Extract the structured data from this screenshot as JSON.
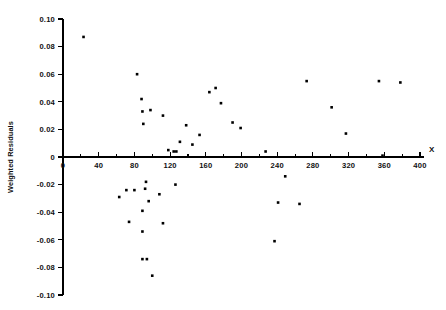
{
  "figure": {
    "title": "",
    "x_axis_name": "X",
    "y_axis_name": "Weighted Residuals"
  },
  "chart_data": {
    "type": "scatter",
    "title": "",
    "xlabel": "X",
    "ylabel": "Weighted Residuals",
    "xlim": [
      0,
      400
    ],
    "ylim": [
      -0.1,
      0.1
    ],
    "grid": false,
    "legend": null,
    "x_ticks_major": [
      0,
      40,
      80,
      120,
      160,
      200,
      240,
      280,
      320,
      360,
      400
    ],
    "x_tick_labels": [
      "0",
      "40",
      "80",
      "120",
      "160",
      "200",
      "240",
      "280",
      "320",
      "360",
      "400"
    ],
    "x_minor_tick_interval": 20,
    "y_ticks_major": [
      0.1,
      0.08,
      0.06,
      0.04,
      0.02,
      0,
      -0.02,
      -0.04,
      -0.06,
      -0.08,
      -0.1
    ],
    "y_tick_labels": [
      "0.10",
      "0.08",
      "0.06",
      "0.04",
      "0.02",
      "0",
      "-0.02",
      "-0.04",
      "-0.06",
      "-0.08",
      "-0.10"
    ],
    "marker": "square",
    "marker_color": "#000000",
    "marker_size_px": 2.6,
    "n_points": 44,
    "points": [
      {
        "x": 23,
        "y": 0.087
      },
      {
        "x": 83,
        "y": 0.06
      },
      {
        "x": 88,
        "y": 0.042
      },
      {
        "x": 89,
        "y": 0.033
      },
      {
        "x": 98,
        "y": 0.034
      },
      {
        "x": 90,
        "y": 0.024
      },
      {
        "x": 112,
        "y": 0.03
      },
      {
        "x": 138,
        "y": 0.023
      },
      {
        "x": 131,
        "y": 0.011
      },
      {
        "x": 118,
        "y": 0.005
      },
      {
        "x": 124,
        "y": 0.004
      },
      {
        "x": 127,
        "y": 0.004
      },
      {
        "x": 164,
        "y": 0.047
      },
      {
        "x": 171,
        "y": 0.05
      },
      {
        "x": 177,
        "y": 0.039
      },
      {
        "x": 190,
        "y": 0.025
      },
      {
        "x": 199,
        "y": 0.021
      },
      {
        "x": 153,
        "y": 0.016
      },
      {
        "x": 145,
        "y": 0.009
      },
      {
        "x": 273,
        "y": 0.055
      },
      {
        "x": 301,
        "y": 0.036
      },
      {
        "x": 354,
        "y": 0.055
      },
      {
        "x": 378,
        "y": 0.054
      },
      {
        "x": 317,
        "y": 0.017
      },
      {
        "x": 358,
        "y": 0.001
      },
      {
        "x": 227,
        "y": 0.004
      },
      {
        "x": 93,
        "y": -0.018
      },
      {
        "x": 92,
        "y": -0.023
      },
      {
        "x": 126,
        "y": -0.02
      },
      {
        "x": 71,
        "y": -0.024
      },
      {
        "x": 80,
        "y": -0.024
      },
      {
        "x": 63,
        "y": -0.029
      },
      {
        "x": 108,
        "y": -0.027
      },
      {
        "x": 96,
        "y": -0.032
      },
      {
        "x": 249,
        "y": -0.014
      },
      {
        "x": 241,
        "y": -0.033
      },
      {
        "x": 265,
        "y": -0.034
      },
      {
        "x": 89,
        "y": -0.039
      },
      {
        "x": 112,
        "y": -0.048
      },
      {
        "x": 74,
        "y": -0.047
      },
      {
        "x": 237,
        "y": -0.061
      },
      {
        "x": 89,
        "y": -0.054
      },
      {
        "x": 89,
        "y": -0.074
      },
      {
        "x": 94,
        "y": -0.074
      },
      {
        "x": 100,
        "y": -0.086
      }
    ]
  }
}
